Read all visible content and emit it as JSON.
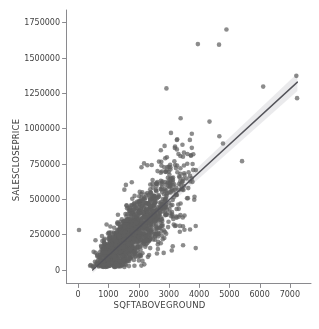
{
  "chart_data": {
    "type": "scatter",
    "title": "",
    "xlabel": "SQFTABOVEGROUND",
    "ylabel": "SALESCLOSEPRICE",
    "xlim": [
      -400,
      7700
    ],
    "ylim": [
      -95000,
      1810000
    ],
    "xticks": [
      0,
      1000,
      2000,
      3000,
      4000,
      5000,
      6000,
      7000
    ],
    "xticklabels": [
      "0",
      "1000",
      "2000",
      "3000",
      "4000",
      "5000",
      "6000",
      "7000"
    ],
    "yticks": [
      0,
      250000,
      500000,
      750000,
      1000000,
      1250000,
      1500000,
      1750000
    ],
    "yticklabels": [
      "0",
      "250000",
      "500000",
      "750000",
      "1000000",
      "1250000",
      "1500000",
      "1750000"
    ],
    "grid": false,
    "legend": null,
    "spines": [
      "left",
      "bottom"
    ],
    "marker": {
      "color": "#5f5f5f",
      "size": 4.6,
      "opacity": 0.72,
      "shape": "circle"
    },
    "regression": {
      "visible": true,
      "color": "#54545a",
      "width": 1.4,
      "slope": 196.5,
      "intercept": -97000,
      "x_start": 480,
      "x_end": 7250,
      "ci_band": true,
      "ci_color": "#bfbfc4",
      "ci_opacity": 0.33,
      "ci_halfwidth_frac": 0.035
    },
    "n_points": 1460,
    "cluster": {
      "x_mean": 1800,
      "x_log_sigma": 0.42,
      "x_min": 330,
      "x_max": 3900,
      "price_noise_sigma": 78000,
      "heteroscedastic": true
    },
    "outliers": [
      {
        "x": 30,
        "y": 280000
      },
      {
        "x": 2920,
        "y": 1283000
      },
      {
        "x": 3960,
        "y": 1597000
      },
      {
        "x": 4660,
        "y": 1593000
      },
      {
        "x": 4905,
        "y": 1700000
      },
      {
        "x": 3390,
        "y": 1072000
      },
      {
        "x": 4345,
        "y": 1048000
      },
      {
        "x": 3070,
        "y": 968000
      },
      {
        "x": 4670,
        "y": 944000
      },
      {
        "x": 3265,
        "y": 918000
      },
      {
        "x": 3450,
        "y": 884000
      },
      {
        "x": 4790,
        "y": 893000
      },
      {
        "x": 2860,
        "y": 876000
      },
      {
        "x": 3760,
        "y": 862000
      },
      {
        "x": 3205,
        "y": 872000
      },
      {
        "x": 2735,
        "y": 845000
      },
      {
        "x": 3500,
        "y": 828000
      },
      {
        "x": 5420,
        "y": 768000
      },
      {
        "x": 6120,
        "y": 1296000
      },
      {
        "x": 7215,
        "y": 1372000
      },
      {
        "x": 7240,
        "y": 1214000
      },
      {
        "x": 3630,
        "y": 506000
      },
      {
        "x": 3160,
        "y": 512000
      },
      {
        "x": 2580,
        "y": 252000
      },
      {
        "x": 2480,
        "y": 213000
      },
      {
        "x": 3380,
        "y": 387000
      },
      {
        "x": 2870,
        "y": 266000
      },
      {
        "x": 2290,
        "y": 739000
      },
      {
        "x": 2095,
        "y": 725000
      },
      {
        "x": 2180,
        "y": 752000
      },
      {
        "x": 2435,
        "y": 741000
      },
      {
        "x": 1775,
        "y": 618000
      },
      {
        "x": 1530,
        "y": 566000
      },
      {
        "x": 3345,
        "y": 661000
      },
      {
        "x": 3585,
        "y": 645000
      },
      {
        "x": 3705,
        "y": 624000
      },
      {
        "x": 575,
        "y": 208000
      },
      {
        "x": 760,
        "y": 168000
      },
      {
        "x": 1140,
        "y": 128000
      },
      {
        "x": 1455,
        "y": 96000
      },
      {
        "x": 1685,
        "y": 77000
      },
      {
        "x": 2010,
        "y": 64000
      }
    ]
  },
  "axes": {
    "x_label": "SQFTABOVEGROUND",
    "y_label": "SALESCLOSEPRICE"
  }
}
